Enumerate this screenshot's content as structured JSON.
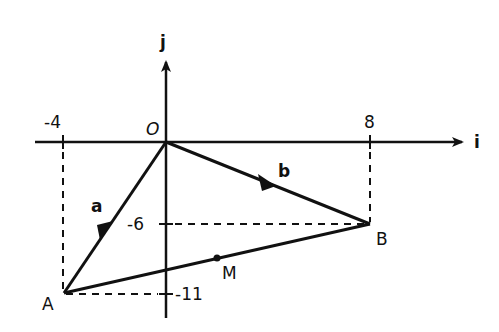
{
  "axes": {
    "x_label": "i",
    "y_label": "j",
    "origin_label": "O",
    "x_ticks": [
      {
        "value": -4,
        "label": "-4"
      },
      {
        "value": 8,
        "label": "8"
      }
    ],
    "y_ticks": [
      {
        "value": -6,
        "label": "-6"
      },
      {
        "value": -11,
        "label": "-11"
      }
    ]
  },
  "points": {
    "O": {
      "label": "O",
      "x": 0,
      "y": 0
    },
    "A": {
      "label": "A",
      "x": -4,
      "y": -11
    },
    "B": {
      "label": "B",
      "x": 8,
      "y": -6
    },
    "M": {
      "label": "M"
    }
  },
  "vectors": {
    "a": {
      "label": "a",
      "from": "O",
      "to": "A"
    },
    "b": {
      "label": "b",
      "from": "O",
      "to": "B"
    }
  },
  "colors": {
    "stroke": "#111111",
    "background": "#ffffff"
  }
}
